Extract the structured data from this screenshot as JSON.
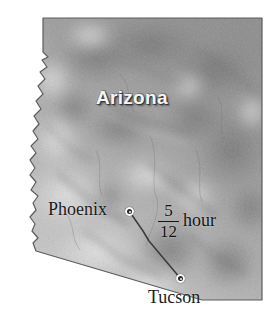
{
  "map": {
    "region_name": "Arizona",
    "style": "grayscale shaded relief",
    "colors": {
      "background": "#ffffff",
      "terrain_light": "#d8d8d8",
      "terrain_mid": "#a8a8a8",
      "terrain_dark": "#767676",
      "border": "#5a5a5a",
      "label_fill": "#f4f4f4",
      "text": "#1b1b1b",
      "route_line": "#3a3a3a"
    }
  },
  "cities": [
    {
      "name": "Phoenix",
      "marker": "city-dot-icon"
    },
    {
      "name": "Tucson",
      "marker": "city-dot-icon"
    }
  ],
  "route": {
    "from": "Phoenix",
    "to": "Tucson",
    "travel_time": {
      "numerator": "5",
      "denominator": "12",
      "unit": "hour"
    }
  }
}
